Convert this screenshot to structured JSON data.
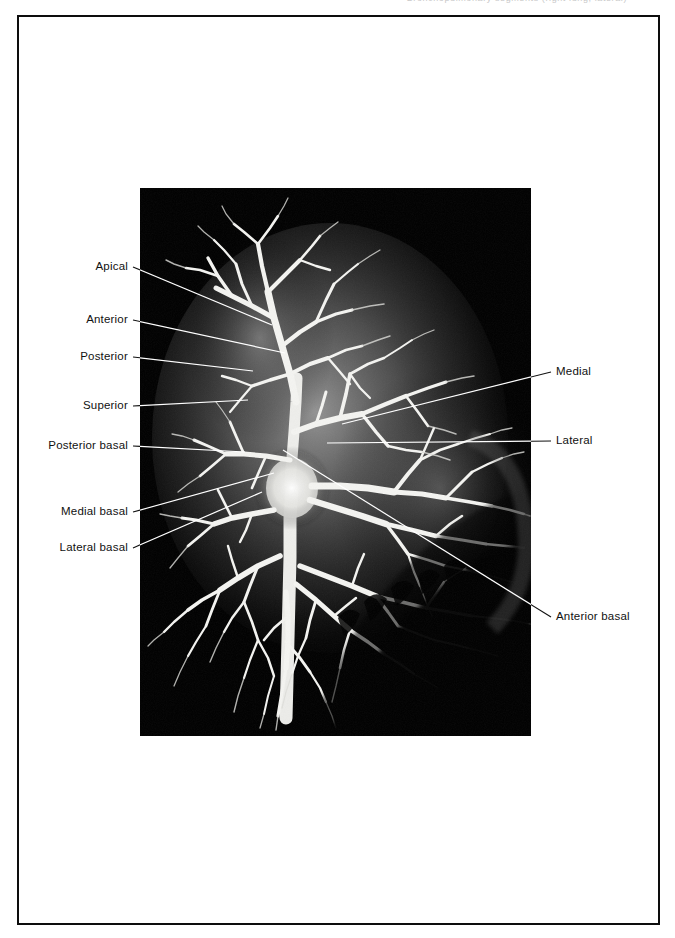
{
  "page": {
    "running_head": "Bronchopulmonary segments (right lung, lateral)",
    "background_color": "#ffffff",
    "border_color": "#0d0d0d"
  },
  "plate": {
    "kind": "bronchogram-radiograph",
    "background_color": "#000000",
    "tree_color": "#f2f2f0",
    "lung_field_color": "#4a4a4a",
    "left": 140,
    "top": 188,
    "width": 391,
    "height": 548
  },
  "labels": {
    "left": [
      {
        "id": "apical",
        "text": "Apical",
        "text_x": 133,
        "text_y": 267,
        "leader": [
          133,
          267,
          272,
          325
        ]
      },
      {
        "id": "anterior",
        "text": "Anterior",
        "text_x": 133,
        "text_y": 320,
        "leader": [
          133,
          320,
          285,
          353
        ]
      },
      {
        "id": "posterior",
        "text": "Posterior",
        "text_x": 133,
        "text_y": 357,
        "leader": [
          133,
          357,
          253,
          371
        ]
      },
      {
        "id": "superior",
        "text": "Superior",
        "text_x": 133,
        "text_y": 406,
        "leader": [
          133,
          406,
          248,
          400
        ]
      },
      {
        "id": "posterior-basal",
        "text": "Posterior basal",
        "text_x": 133,
        "text_y": 446,
        "leader": [
          133,
          446,
          245,
          452
        ]
      },
      {
        "id": "medial-basal",
        "text": "Medial basal",
        "text_x": 133,
        "text_y": 512,
        "leader": [
          133,
          512,
          274,
          473
        ]
      },
      {
        "id": "lateral-basal",
        "text": "Lateral basal",
        "text_x": 133,
        "text_y": 548,
        "leader": [
          133,
          548,
          262,
          492
        ]
      }
    ],
    "right": [
      {
        "id": "medial",
        "text": "Medial",
        "text_x": 556,
        "text_y": 372,
        "leader": [
          551,
          372,
          342,
          424
        ]
      },
      {
        "id": "lateral",
        "text": "Lateral",
        "text_x": 556,
        "text_y": 441,
        "leader": [
          551,
          441,
          327,
          443
        ]
      },
      {
        "id": "anterior-basal",
        "text": "Anterior basal",
        "text_x": 556,
        "text_y": 617,
        "leader": [
          551,
          617,
          283,
          450
        ]
      }
    ]
  },
  "leader_style": {
    "outside_color": "#111111",
    "inside_color": "#ffffff",
    "width": 1.1
  }
}
